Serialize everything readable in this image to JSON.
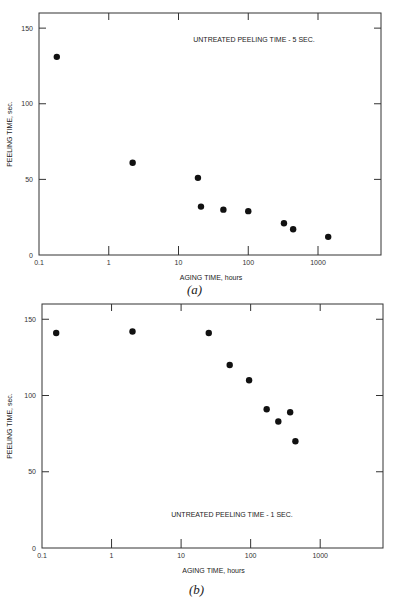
{
  "chart_data": [
    {
      "type": "scatter",
      "panel": "a",
      "caption": "(a)",
      "title": "",
      "annotation": "UNTREATED PEELING TIME - 5 SEC.",
      "xlabel": "AGING TIME, hours",
      "ylabel": "PEELING TIME, sec.",
      "xscale": "log",
      "xlim": [
        0.1,
        8000
      ],
      "ylim": [
        0,
        160
      ],
      "xticks": [
        0.1,
        1,
        10,
        100,
        1000
      ],
      "xtick_labels": [
        "0.1",
        "1",
        "10",
        "100",
        "1000"
      ],
      "yticks": [
        0,
        50,
        100,
        150
      ],
      "ytick_labels": [
        "0",
        "50",
        "100",
        "150"
      ],
      "grid": false,
      "legend": null,
      "x": [
        0.18,
        2.2,
        19,
        21,
        44,
        100,
        325,
        440,
        1400
      ],
      "y": [
        131,
        61,
        51,
        32,
        30,
        29,
        21,
        17,
        12
      ]
    },
    {
      "type": "scatter",
      "panel": "b",
      "caption": "(b)",
      "title": "",
      "annotation": "UNTREATED PEELING TIME - 1 SEC.",
      "xlabel": "AGING TIME, hours",
      "ylabel": "PEELING TIME, sec.",
      "xscale": "log",
      "xlim": [
        0.1,
        8000
      ],
      "ylim": [
        0,
        160
      ],
      "xticks": [
        0.1,
        1,
        10,
        100,
        1000
      ],
      "xtick_labels": [
        "0.1",
        "1",
        "10",
        "100",
        "1000"
      ],
      "yticks": [
        0,
        50,
        100,
        150
      ],
      "ytick_labels": [
        "0",
        "50",
        "100",
        "150"
      ],
      "grid": false,
      "legend": null,
      "x": [
        0.16,
        2,
        25,
        50,
        95,
        170,
        250,
        370,
        440
      ],
      "y": [
        141,
        142,
        141,
        120,
        110,
        91,
        83,
        89,
        70
      ]
    }
  ],
  "figures": {
    "a": {
      "caption": "(a)",
      "annotation": "UNTREATED PEELING TIME - 5 SEC.",
      "xlabel": "AGING TIME, hours",
      "ylabel": "PEELING TIME, sec."
    },
    "b": {
      "caption": "(b)",
      "annotation": "UNTREATED PEELING TIME - 1 SEC.",
      "xlabel": "AGING TIME, hours",
      "ylabel": "PEELING TIME, sec."
    }
  },
  "colors": {
    "axis": "#333333",
    "point": "#111111",
    "background": "#ffffff"
  }
}
